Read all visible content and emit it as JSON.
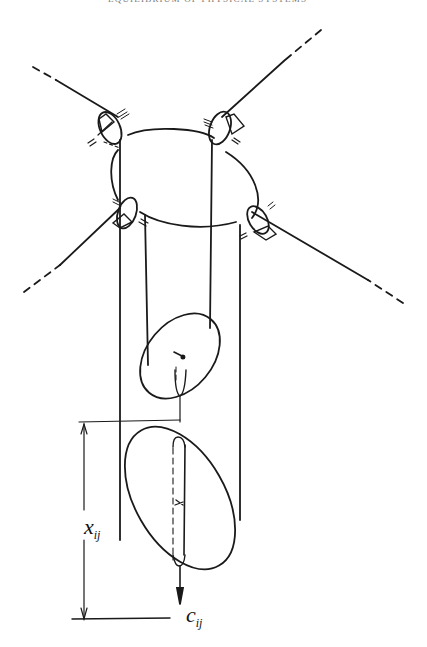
{
  "header": {
    "title": "EQUILIBRIUM OF PHYSICAL SYSTEMS",
    "page_number": ""
  },
  "figure": {
    "labels": {
      "x_var": "x",
      "x_sub": "ij",
      "c_var": "c",
      "c_sub": "ij"
    },
    "colors": {
      "ink": "#1a1a1a",
      "paper": "#ffffff"
    }
  }
}
